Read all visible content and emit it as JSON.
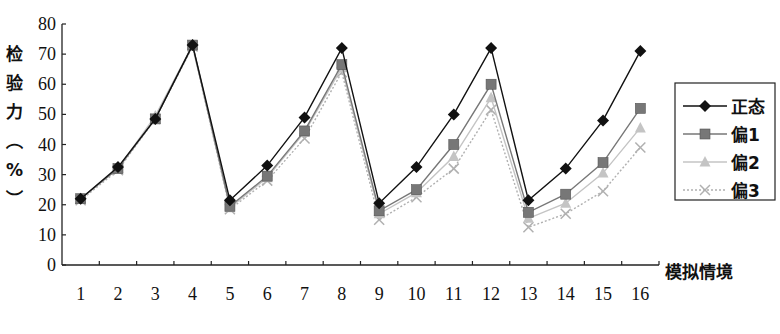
{
  "chart_data": {
    "type": "line",
    "title": "",
    "xlabel": "模拟情境",
    "ylabel": "检验力（%）",
    "ylabel_chars": [
      "检",
      "验",
      "力",
      "︵",
      "%",
      "︶"
    ],
    "ylim": [
      0,
      80
    ],
    "yticks": [
      0,
      10,
      20,
      30,
      40,
      50,
      60,
      70,
      80
    ],
    "grid": false,
    "legend_position": "right",
    "categories": [
      "1",
      "2",
      "3",
      "4",
      "5",
      "6",
      "7",
      "8",
      "9",
      "10",
      "11",
      "12",
      "13",
      "14",
      "15",
      "16"
    ],
    "series": [
      {
        "name": "正态",
        "marker": "diamond",
        "color": "#111111",
        "dash": "",
        "values": [
          22,
          32.5,
          48.5,
          73,
          21.5,
          33,
          49,
          72,
          20.5,
          32.5,
          50,
          72,
          21.5,
          32,
          48,
          71
        ]
      },
      {
        "name": "偏1",
        "marker": "square",
        "color": "#777777",
        "dash": "",
        "values": [
          22,
          32,
          48.5,
          73,
          19.5,
          29.5,
          44.5,
          66.5,
          18,
          25,
          40,
          60,
          17.5,
          23.5,
          34,
          52
        ]
      },
      {
        "name": "偏2",
        "marker": "triangle",
        "color": "#c4c4c4",
        "dash": "",
        "values": [
          22,
          32,
          49.5,
          73,
          19,
          29,
          44,
          65.5,
          17,
          24,
          36,
          55.5,
          15.5,
          20.5,
          30.5,
          45.5
        ]
      },
      {
        "name": "偏3",
        "marker": "x",
        "color": "#b0b0b0",
        "dash": "2,2",
        "values": [
          21.5,
          31.5,
          48.5,
          72.5,
          18.5,
          28,
          42,
          64,
          15,
          22.5,
          32,
          51.5,
          12.5,
          17,
          24.5,
          39
        ]
      }
    ]
  }
}
